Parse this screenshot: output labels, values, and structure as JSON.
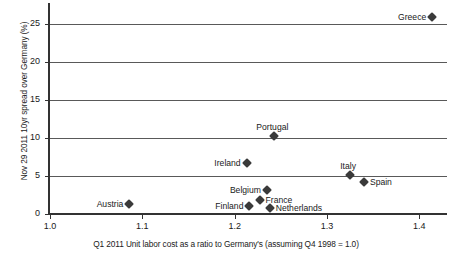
{
  "chart_data": {
    "type": "scatter",
    "title": "",
    "xlabel": "Q1 2011 Unit labor cost as a ratio to Germany's (assuming Q4 1998 = 1.0)",
    "ylabel": "Nov 29 2011 10yr spread over Germany (%)",
    "xlim": [
      1.0,
      1.43
    ],
    "ylim": [
      0,
      26.5
    ],
    "xticks": [
      1.0,
      1.1,
      1.2,
      1.3,
      1.4
    ],
    "xtick_labels": [
      "1.0",
      "1.1",
      "1.2",
      "1.3",
      "1.4"
    ],
    "yticks": [
      0,
      5,
      10,
      15,
      20,
      25
    ],
    "ytick_labels": [
      "0",
      "5",
      "10",
      "15",
      "20",
      "25"
    ],
    "grid": "horizontal",
    "legend": "none",
    "marker": "diamond",
    "marker_color": "#3a3a3a",
    "points": [
      {
        "name": "Greece",
        "x": 1.414,
        "y": 26.0,
        "label_side": "left"
      },
      {
        "name": "Portugal",
        "x": 1.243,
        "y": 10.3,
        "label_side": "above"
      },
      {
        "name": "Ireland",
        "x": 1.213,
        "y": 6.7,
        "label_side": "left"
      },
      {
        "name": "Italy",
        "x": 1.325,
        "y": 5.1,
        "label_side": "above"
      },
      {
        "name": "Spain",
        "x": 1.34,
        "y": 4.2,
        "label_side": "right"
      },
      {
        "name": "Belgium",
        "x": 1.235,
        "y": 3.1,
        "label_side": "left"
      },
      {
        "name": "France",
        "x": 1.227,
        "y": 1.9,
        "label_side": "right"
      },
      {
        "name": "Finland",
        "x": 1.216,
        "y": 1.0,
        "label_side": "left"
      },
      {
        "name": "Netherlands",
        "x": 1.238,
        "y": 0.8,
        "label_side": "right"
      },
      {
        "name": "Austria",
        "x": 1.086,
        "y": 1.3,
        "label_side": "left"
      }
    ]
  }
}
